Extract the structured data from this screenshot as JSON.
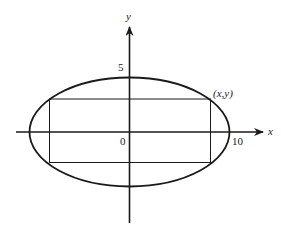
{
  "diagram": {
    "type": "ellipse with inscribed rectangle",
    "axes": {
      "x_label": "x",
      "y_label": "y"
    },
    "tick_labels": {
      "origin": "0",
      "x_intercept": "10",
      "y_intercept": "5"
    },
    "point_label": "(x,y)",
    "ellipse": {
      "semi_major_x": 10,
      "semi_minor_y": 5,
      "center": [
        0,
        0
      ]
    },
    "rectangle": {
      "corner_label": "(x,y)",
      "inscribed": true
    },
    "colors": {
      "stroke": "#1a1a1a",
      "background": "#ffffff"
    }
  }
}
